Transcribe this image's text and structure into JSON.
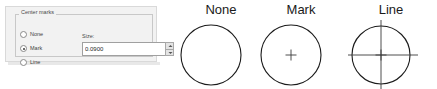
{
  "panel": {
    "group": {
      "legend": "Center marks",
      "options": [
        {
          "label": "None",
          "selected": false
        },
        {
          "label": "Mark",
          "selected": true
        },
        {
          "label": "Line",
          "selected": false
        }
      ],
      "size_label": "Size:",
      "size_value": "0.0900"
    }
  },
  "diagrams": [
    {
      "title": "None",
      "style": "plain-circle"
    },
    {
      "title": "Mark",
      "style": "circle-with-center-mark"
    },
    {
      "title": "Line",
      "style": "circle-with-center-lines"
    }
  ],
  "colors": {
    "panel_background": "#f2f2f2",
    "panel_border": "#d9d9d9",
    "group_border": "#c8c8c8",
    "text": "#3f3f3f",
    "diagram_stroke": "#1a1a1a",
    "diagram_title": "#1a1a1a",
    "input_background": "#ffffff",
    "input_border": "#a0a0a0"
  }
}
